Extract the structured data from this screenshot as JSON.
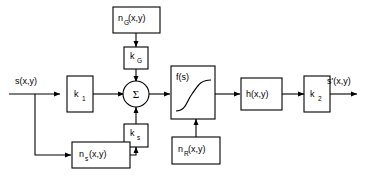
{
  "diagram": {
    "type": "block-diagram",
    "stroke_color": "#000000",
    "background_color": "#ffffff",
    "signals": {
      "input_label": "s(x,y)",
      "output_label": "s'(x,y)"
    },
    "blocks": [
      {
        "id": "k1",
        "label_main": "k",
        "label_sub": "1",
        "shape": "rect"
      },
      {
        "id": "sum",
        "label_main": "Σ",
        "label_sub": "",
        "shape": "circle"
      },
      {
        "id": "fs",
        "label_main": "f(s)",
        "label_sub": "",
        "shape": "rect-sigmoid"
      },
      {
        "id": "h",
        "label_main": "h(x,y)",
        "label_sub": "",
        "shape": "rect"
      },
      {
        "id": "k2",
        "label_main": "k",
        "label_sub": "2",
        "shape": "rect"
      },
      {
        "id": "nG",
        "label_main": "n",
        "label_sub": "G",
        "label_tail": "(x,y)",
        "shape": "rect"
      },
      {
        "id": "kG",
        "label_main": "k",
        "label_sub": "G",
        "shape": "rect"
      },
      {
        "id": "ks",
        "label_main": "k",
        "label_sub": "s",
        "shape": "rect"
      },
      {
        "id": "ns",
        "label_main": "n",
        "label_sub": "s",
        "label_tail": " (x,y)",
        "shape": "rect"
      },
      {
        "id": "nR",
        "label_main": "n",
        "label_sub": "R",
        "label_tail": "(x,y)",
        "shape": "rect"
      }
    ],
    "labels": {
      "k1_main": "k",
      "k1_sub": "1",
      "k2_main": "k",
      "k2_sub": "2",
      "kG_main": "k",
      "kG_sub": "G",
      "ks_main": "k",
      "ks_sub": "s",
      "nG_main": "n",
      "nG_sub": "G",
      "nG_tail": "(x,y)",
      "ns_main": "n",
      "ns_sub": "s",
      "ns_tail": " (x,y)",
      "nR_main": "n",
      "nR_sub": "R",
      "nR_tail": "(x,y)",
      "fs": "f(s)",
      "h": "h(x,y)",
      "sigma": "Σ",
      "input": "s(x,y)",
      "output": "s'(x,y)"
    }
  }
}
